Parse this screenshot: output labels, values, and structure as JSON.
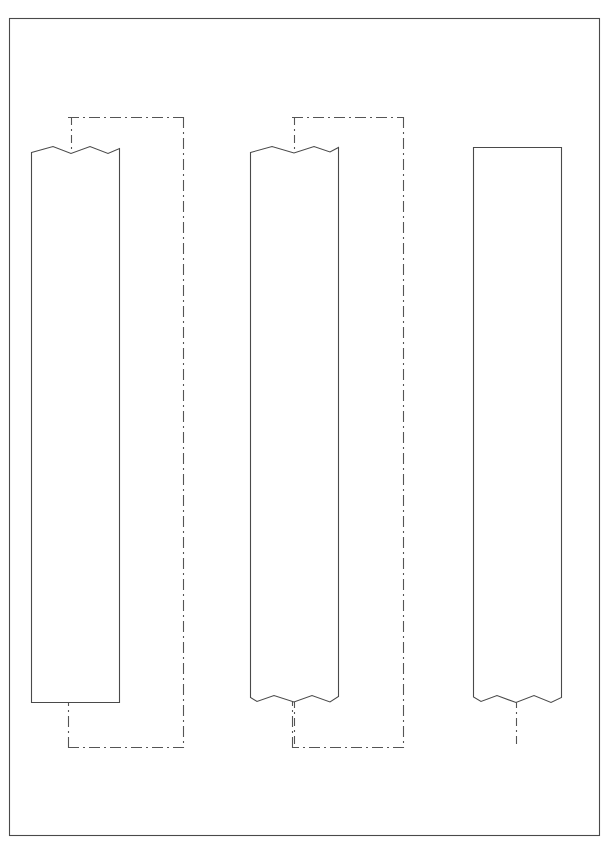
{
  "drawing": {
    "title": "Structural bar and chain-line layout drawing",
    "canvas": {
      "width": 609,
      "height": 852
    },
    "background_color": "#ffffff",
    "line_color": "#4a4a4a",
    "chain_line_color": "#555555",
    "sheet_border": {
      "x": 9,
      "y": 18,
      "width": 591,
      "height": 818
    },
    "bars": [
      {
        "name": "bar-left",
        "x": 31,
        "y": 147,
        "width": 89,
        "height": 556,
        "top_break": true,
        "bottom_break": false,
        "label": ""
      },
      {
        "name": "bar-middle",
        "x": 250,
        "y": 146,
        "width": 89,
        "height": 556,
        "top_break": true,
        "bottom_break": true,
        "label": ""
      },
      {
        "name": "bar-right",
        "x": 473,
        "y": 147,
        "width": 89,
        "height": 556,
        "top_break": false,
        "bottom_break": true,
        "label": ""
      }
    ],
    "chain_loops": [
      {
        "name": "chain-loop-left",
        "left": 68,
        "right": 184,
        "top": 117,
        "bottom": 748,
        "tick_x": 71,
        "tick_top": 117,
        "tick_bottom": 152,
        "label": ""
      },
      {
        "name": "chain-loop-right",
        "left": 292,
        "right": 404,
        "top": 117,
        "bottom": 748,
        "tick_x": 294,
        "tick_top": 117,
        "tick_bottom": 150,
        "label": ""
      }
    ],
    "connector_ticks": [
      {
        "name": "tick-bar-middle-bottom",
        "x": 294,
        "y1": 702,
        "y2": 748
      },
      {
        "name": "tick-bar-right-bottom",
        "x": 516,
        "y1": 702,
        "y2": 748
      }
    ],
    "dash_pattern": "11 4 2 4"
  }
}
